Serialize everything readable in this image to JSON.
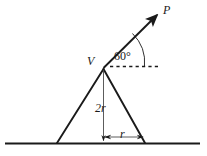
{
  "figure": {
    "type": "geometry-diagram",
    "stroke_color": "#1a1a1a",
    "background_color": "#ffffff",
    "labels": {
      "force_vector": "P",
      "apex_vertex": "V",
      "angle": "60°",
      "height": "2r",
      "half_base": "r"
    },
    "geometry": {
      "apex": {
        "x": 103,
        "y": 68
      },
      "base_left": {
        "x": 57,
        "y": 143
      },
      "base_right": {
        "x": 145,
        "y": 143
      },
      "ground_line": {
        "x1": 5,
        "x2": 200,
        "y": 143
      },
      "ray_tip": {
        "x": 158,
        "y": 14
      },
      "dashed_line": {
        "x1": 110,
        "x2": 158,
        "y": 66
      },
      "height_line": {
        "x": 103,
        "y1": 70,
        "y2": 141
      },
      "dimension_line": {
        "x1": 104,
        "x2": 144,
        "y": 137
      },
      "angle_arc_radius": 40
    }
  }
}
